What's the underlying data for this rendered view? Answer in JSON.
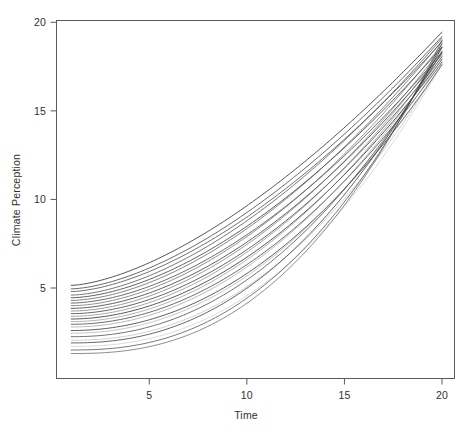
{
  "chart_data": {
    "type": "line",
    "title": "",
    "xlabel": "Time",
    "ylabel": "Climate Perception",
    "xlim": [
      1,
      20
    ],
    "ylim": [
      1,
      20
    ],
    "xticks": [
      5,
      10,
      15,
      20
    ],
    "yticks": [
      5,
      10,
      15,
      20
    ],
    "xtick_labels": [
      "5",
      "10",
      "15",
      "20"
    ],
    "ytick_labels": [
      "5",
      "10",
      "15",
      "20"
    ],
    "grid": false,
    "legend": "none",
    "n_series": 24,
    "x": [
      1,
      2,
      3,
      4,
      5,
      6,
      7,
      8,
      9,
      10,
      11,
      12,
      13,
      14,
      15,
      16,
      17,
      18,
      19,
      20
    ],
    "series": [
      {
        "name": "subject-01",
        "color": "#222222",
        "opacity": 0.85,
        "start": 5.15,
        "end": 19.45,
        "curvature": 1.55
      },
      {
        "name": "subject-02",
        "color": "#2e2e2e",
        "opacity": 0.8,
        "start": 4.95,
        "end": 19.2,
        "curvature": 1.6
      },
      {
        "name": "subject-03",
        "color": "#3a3a3a",
        "opacity": 0.8,
        "start": 4.8,
        "end": 18.9,
        "curvature": 1.62
      },
      {
        "name": "subject-04",
        "color": "#3f3f3f",
        "opacity": 0.78,
        "start": 4.6,
        "end": 19.1,
        "curvature": 1.66
      },
      {
        "name": "subject-05",
        "color": "#2a2a2a",
        "opacity": 0.82,
        "start": 4.45,
        "end": 18.6,
        "curvature": 1.68
      },
      {
        "name": "subject-06",
        "color": "#4a4a4a",
        "opacity": 0.75,
        "start": 4.3,
        "end": 18.95,
        "curvature": 1.72
      },
      {
        "name": "subject-07",
        "color": "#353535",
        "opacity": 0.8,
        "start": 4.15,
        "end": 18.3,
        "curvature": 1.74
      },
      {
        "name": "subject-08",
        "color": "#555555",
        "opacity": 0.72,
        "start": 4.0,
        "end": 18.75,
        "curvature": 1.78
      },
      {
        "name": "subject-09",
        "color": "#2d2d2d",
        "opacity": 0.84,
        "start": 3.85,
        "end": 18.2,
        "curvature": 1.8
      },
      {
        "name": "subject-10",
        "color": "#606060",
        "opacity": 0.7,
        "start": 3.7,
        "end": 18.55,
        "curvature": 1.84
      },
      {
        "name": "subject-11",
        "color": "#303030",
        "opacity": 0.82,
        "start": 3.55,
        "end": 18.05,
        "curvature": 1.86
      },
      {
        "name": "subject-12",
        "color": "#6b6b6b",
        "opacity": 0.66,
        "start": 3.4,
        "end": 18.4,
        "curvature": 1.9
      },
      {
        "name": "subject-13",
        "color": "#262626",
        "opacity": 0.86,
        "start": 3.25,
        "end": 17.9,
        "curvature": 1.92
      },
      {
        "name": "subject-14",
        "color": "#757575",
        "opacity": 0.62,
        "start": 3.1,
        "end": 18.25,
        "curvature": 1.96
      },
      {
        "name": "subject-15",
        "color": "#333333",
        "opacity": 0.8,
        "start": 2.95,
        "end": 17.75,
        "curvature": 1.98
      },
      {
        "name": "subject-16",
        "color": "#808080",
        "opacity": 0.6,
        "start": 2.8,
        "end": 18.1,
        "curvature": 2.02
      },
      {
        "name": "subject-17",
        "color": "#2b2b2b",
        "opacity": 0.84,
        "start": 2.6,
        "end": 17.6,
        "curvature": 2.06
      },
      {
        "name": "subject-18",
        "color": "#8c8c8c",
        "opacity": 0.55,
        "start": 2.45,
        "end": 17.95,
        "curvature": 2.1
      },
      {
        "name": "subject-19",
        "color": "#383838",
        "opacity": 0.78,
        "start": 2.25,
        "end": 18.35,
        "curvature": 2.16
      },
      {
        "name": "subject-20",
        "color": "#9a9a9a",
        "opacity": 0.5,
        "start": 2.05,
        "end": 17.7,
        "curvature": 2.2
      },
      {
        "name": "subject-21",
        "color": "#2f2f2f",
        "opacity": 0.82,
        "start": 1.9,
        "end": 18.6,
        "curvature": 2.26
      },
      {
        "name": "subject-22",
        "color": "#a8a8a8",
        "opacity": 0.45,
        "start": 1.7,
        "end": 17.65,
        "curvature": 2.3
      },
      {
        "name": "subject-23",
        "color": "#3c3c3c",
        "opacity": 0.78,
        "start": 1.5,
        "end": 18.8,
        "curvature": 2.38
      },
      {
        "name": "subject-24",
        "color": "#4f4f4f",
        "opacity": 0.72,
        "start": 1.3,
        "end": 19.0,
        "curvature": 2.45
      }
    ]
  },
  "axes": {
    "x_axis_name": "Time",
    "y_axis_name": "Climate Perception"
  }
}
